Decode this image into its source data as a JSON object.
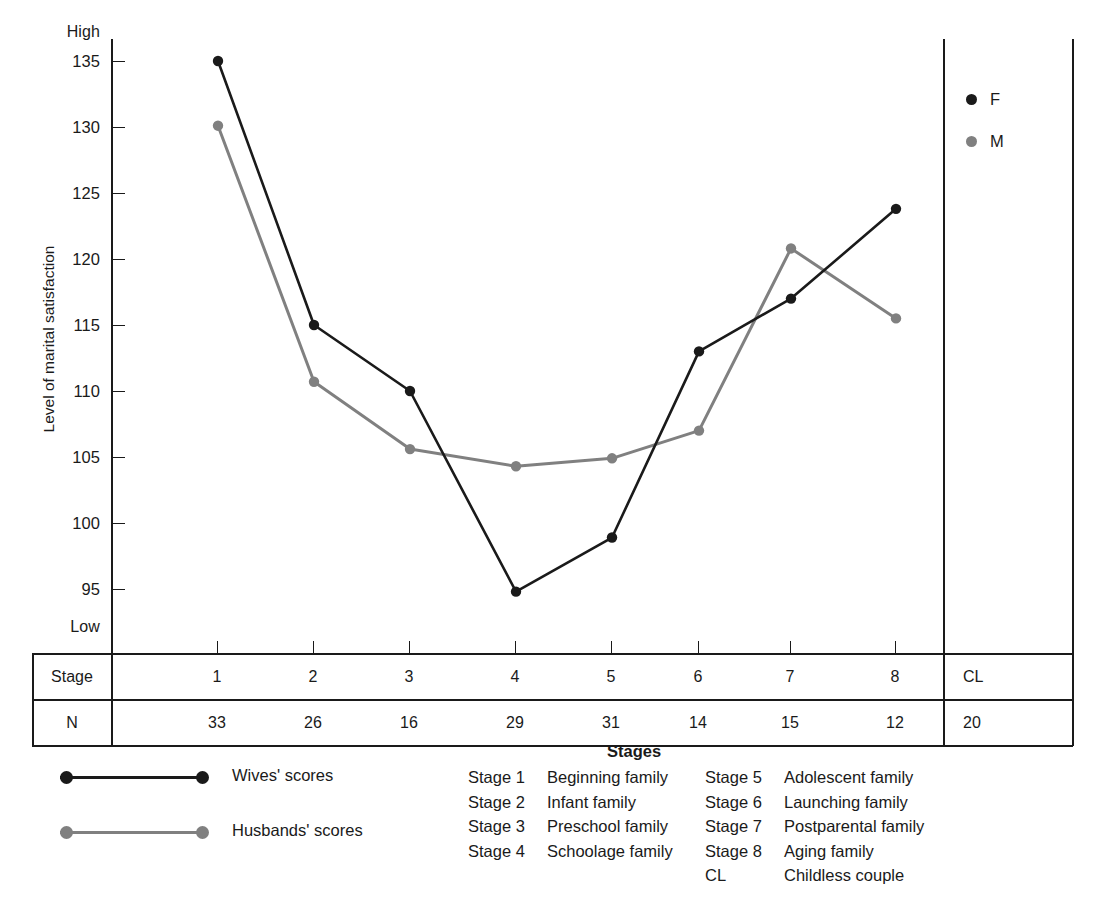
{
  "chart_data": {
    "type": "line",
    "title": "",
    "xlabel": "Stages",
    "ylabel": "Level of marital satisfaction",
    "categories": [
      "1",
      "2",
      "3",
      "4",
      "5",
      "6",
      "7",
      "8"
    ],
    "ylim": [
      90,
      140
    ],
    "y_ticks": [
      "135",
      "130",
      "125",
      "120",
      "115",
      "110",
      "105",
      "100",
      "95"
    ],
    "y_tick_values": [
      135,
      130,
      125,
      120,
      115,
      110,
      105,
      100,
      95
    ],
    "y_axis_high_label": "High",
    "y_axis_low_label": "Low",
    "grid": false,
    "legend_position": "upper-right-inside",
    "series": [
      {
        "name": "F",
        "long_name": "Wives' scores",
        "color": "#1a1a1a",
        "values": [
          135.0,
          115.0,
          110.0,
          94.8,
          98.9,
          113.0,
          117.0,
          123.8
        ]
      },
      {
        "name": "M",
        "long_name": "Husbands' scores",
        "color": "#808080",
        "values": [
          130.1,
          110.7,
          105.6,
          104.3,
          104.9,
          107.0,
          120.8,
          115.5
        ]
      }
    ]
  },
  "plot_legend": [
    {
      "label": "F",
      "color": "#1a1a1a"
    },
    {
      "label": "M",
      "color": "#808080"
    }
  ],
  "table": {
    "rows": [
      {
        "header": "Stage",
        "cells": [
          "1",
          "2",
          "3",
          "4",
          "5",
          "6",
          "7",
          "8"
        ],
        "extra": "CL"
      },
      {
        "header": "N",
        "cells": [
          "33",
          "26",
          "16",
          "29",
          "31",
          "14",
          "15",
          "12"
        ],
        "extra": "20"
      }
    ]
  },
  "series_key": [
    {
      "label": "Wives' scores",
      "color": "#1a1a1a"
    },
    {
      "label": "Husbands' scores",
      "color": "#808080"
    }
  ],
  "stages_caption": {
    "title": "Stages",
    "left_column": [
      {
        "num": "Stage 1",
        "desc": "Beginning family"
      },
      {
        "num": "Stage 2",
        "desc": "Infant family"
      },
      {
        "num": "Stage 3",
        "desc": "Preschool family"
      },
      {
        "num": "Stage 4",
        "desc": "Schoolage family"
      }
    ],
    "right_column": [
      {
        "num": "Stage 5",
        "desc": "Adolescent family"
      },
      {
        "num": "Stage 6",
        "desc": "Launching family"
      },
      {
        "num": "Stage 7",
        "desc": "Postparental family"
      },
      {
        "num": "Stage 8",
        "desc": "Aging family"
      },
      {
        "num": "CL",
        "desc": "Childless couple"
      }
    ]
  }
}
